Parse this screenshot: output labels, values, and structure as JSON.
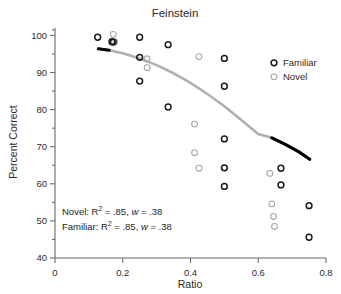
{
  "chart_data": {
    "type": "scatter",
    "title": "Feinstein",
    "xlabel": "Ratio",
    "ylabel": "Percent Correct",
    "xlim": [
      0,
      0.8
    ],
    "ylim": [
      40,
      102
    ],
    "xticks": [
      0,
      0.2,
      0.4,
      0.6,
      0.8
    ],
    "xticklabels": [
      "0",
      "0.2",
      "0.4",
      "0.6",
      "0.8"
    ],
    "yticks": [
      40,
      50,
      60,
      70,
      80,
      90,
      100
    ],
    "yticklabels": [
      "40",
      "50",
      "60",
      "70",
      "80",
      "90",
      "100"
    ],
    "yminorticks": [
      45,
      55,
      65,
      75,
      85,
      95
    ],
    "grid": false,
    "legend_position": "upper right",
    "colors": {
      "familiar": "#1d1d1d",
      "novel": "#a6a6a6",
      "curve_middle": "#b0b0b0",
      "curve_ends": "#000000",
      "axis": "#6b6b6b"
    },
    "series": [
      {
        "name": "Familiar",
        "marker": "open-circle",
        "color": "#1d1d1d",
        "points": [
          {
            "x": 0.126,
            "y": 99.5
          },
          {
            "x": 0.168,
            "y": 98.3
          },
          {
            "x": 0.172,
            "y": 98.2
          },
          {
            "x": 0.25,
            "y": 99.5
          },
          {
            "x": 0.25,
            "y": 94.1
          },
          {
            "x": 0.25,
            "y": 87.7
          },
          {
            "x": 0.334,
            "y": 97.5
          },
          {
            "x": 0.334,
            "y": 80.7
          },
          {
            "x": 0.5,
            "y": 93.8
          },
          {
            "x": 0.5,
            "y": 86.3
          },
          {
            "x": 0.5,
            "y": 72.1
          },
          {
            "x": 0.5,
            "y": 64.3
          },
          {
            "x": 0.5,
            "y": 59.3
          },
          {
            "x": 0.667,
            "y": 64.2
          },
          {
            "x": 0.667,
            "y": 59.7
          },
          {
            "x": 0.75,
            "y": 54.1
          },
          {
            "x": 0.75,
            "y": 45.6
          }
        ]
      },
      {
        "name": "Novel",
        "marker": "open-circle",
        "color": "#a6a6a6",
        "points": [
          {
            "x": 0.172,
            "y": 100.3
          },
          {
            "x": 0.176,
            "y": 98.3
          },
          {
            "x": 0.272,
            "y": 93.7
          },
          {
            "x": 0.272,
            "y": 91.3
          },
          {
            "x": 0.412,
            "y": 76.1
          },
          {
            "x": 0.412,
            "y": 68.4
          },
          {
            "x": 0.425,
            "y": 94.3
          },
          {
            "x": 0.425,
            "y": 64.2
          },
          {
            "x": 0.5,
            "y": 64.3
          },
          {
            "x": 0.634,
            "y": 62.8
          },
          {
            "x": 0.64,
            "y": 54.6
          },
          {
            "x": 0.645,
            "y": 51.2
          },
          {
            "x": 0.648,
            "y": 48.5
          }
        ]
      }
    ],
    "fit_curve": {
      "description": "quadratic-like decreasing fit, black at both ends, gray in the middle",
      "points": [
        {
          "x": 0.128,
          "y": 96.4
        },
        {
          "x": 0.16,
          "y": 96.0
        },
        {
          "x": 0.2,
          "y": 95.2
        },
        {
          "x": 0.25,
          "y": 93.8
        },
        {
          "x": 0.3,
          "y": 92.0
        },
        {
          "x": 0.35,
          "y": 89.8
        },
        {
          "x": 0.4,
          "y": 87.2
        },
        {
          "x": 0.45,
          "y": 84.2
        },
        {
          "x": 0.5,
          "y": 80.9
        },
        {
          "x": 0.55,
          "y": 77.2
        },
        {
          "x": 0.6,
          "y": 73.4
        },
        {
          "x": 0.64,
          "y": 72.4
        },
        {
          "x": 0.68,
          "y": 70.6
        },
        {
          "x": 0.72,
          "y": 68.6
        },
        {
          "x": 0.752,
          "y": 66.6
        }
      ],
      "black_start_range": [
        0.128,
        0.185
      ],
      "black_end_range": [
        0.64,
        0.752
      ]
    },
    "annotations": [
      {
        "id": "novel-stat",
        "prefix": "Novel: R",
        "sup": "2",
        "mid": " = .85, ",
        "italic": "w",
        "suffix": " = .38"
      },
      {
        "id": "familiar-stat",
        "prefix": "Familiar: R",
        "sup": "2",
        "mid": " = .85, ",
        "italic": "w",
        "suffix": " = .38"
      }
    ],
    "legend": [
      {
        "label": "Familiar",
        "color": "#1d1d1d"
      },
      {
        "label": "Novel",
        "color": "#a6a6a6"
      }
    ]
  }
}
